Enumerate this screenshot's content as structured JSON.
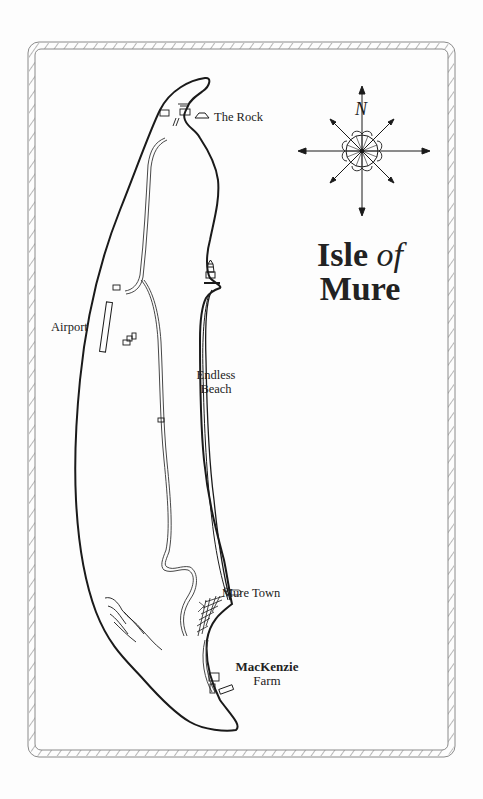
{
  "map": {
    "title_line1": "Isle",
    "title_of": "of",
    "title_line2": "Mure",
    "compass": {
      "north_label": "N"
    },
    "places": [
      {
        "id": "the-rock",
        "name": "The Rock"
      },
      {
        "id": "airport",
        "name": "Airport"
      },
      {
        "id": "endless-beach",
        "line1": "Endless",
        "line2": "Beach"
      },
      {
        "id": "mure-town",
        "name": "Mure Town"
      },
      {
        "id": "mackenzie-farm",
        "line1": "MacKenzie",
        "line2": "Farm"
      }
    ],
    "colors": {
      "ink": "#1a1a1a",
      "border": "#888888",
      "paper": "#fdfdfd"
    }
  }
}
